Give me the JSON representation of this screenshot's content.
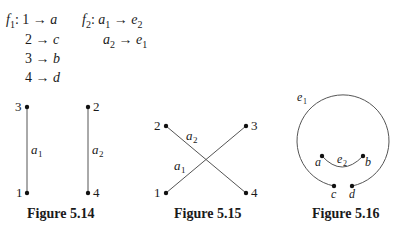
{
  "mappings": {
    "f1": {
      "name": "f",
      "sub": "1",
      "rows": [
        {
          "from": "1",
          "to": "a"
        },
        {
          "from": "2",
          "to": "c"
        },
        {
          "from": "3",
          "to": "b"
        },
        {
          "from": "4",
          "to": "d"
        }
      ]
    },
    "f2": {
      "name": "f",
      "sub": "2",
      "rows": [
        {
          "from": "a",
          "from_sub": "1",
          "to": "e",
          "to_sub": "2"
        },
        {
          "from": "a",
          "from_sub": "2",
          "to": "e",
          "to_sub": "1"
        }
      ]
    },
    "arrow": "→",
    "colon": ":"
  },
  "figures": [
    {
      "caption": "Figure 5.14",
      "vertices": [
        "3",
        "1",
        "2",
        "4"
      ],
      "edges": [
        {
          "label": "a",
          "sub": "1"
        },
        {
          "label": "a",
          "sub": "2"
        }
      ]
    },
    {
      "caption": "Figure 5.15",
      "vertices": [
        "2",
        "3",
        "1",
        "4"
      ],
      "edges": [
        {
          "label": "a",
          "sub": "2"
        },
        {
          "label": "a",
          "sub": "1"
        }
      ]
    },
    {
      "caption": "Figure 5.16",
      "vertices": [
        "a",
        "b",
        "c",
        "d"
      ],
      "edges": [
        {
          "label": "e",
          "sub": "1"
        },
        {
          "label": "e",
          "sub": "2"
        }
      ]
    }
  ]
}
